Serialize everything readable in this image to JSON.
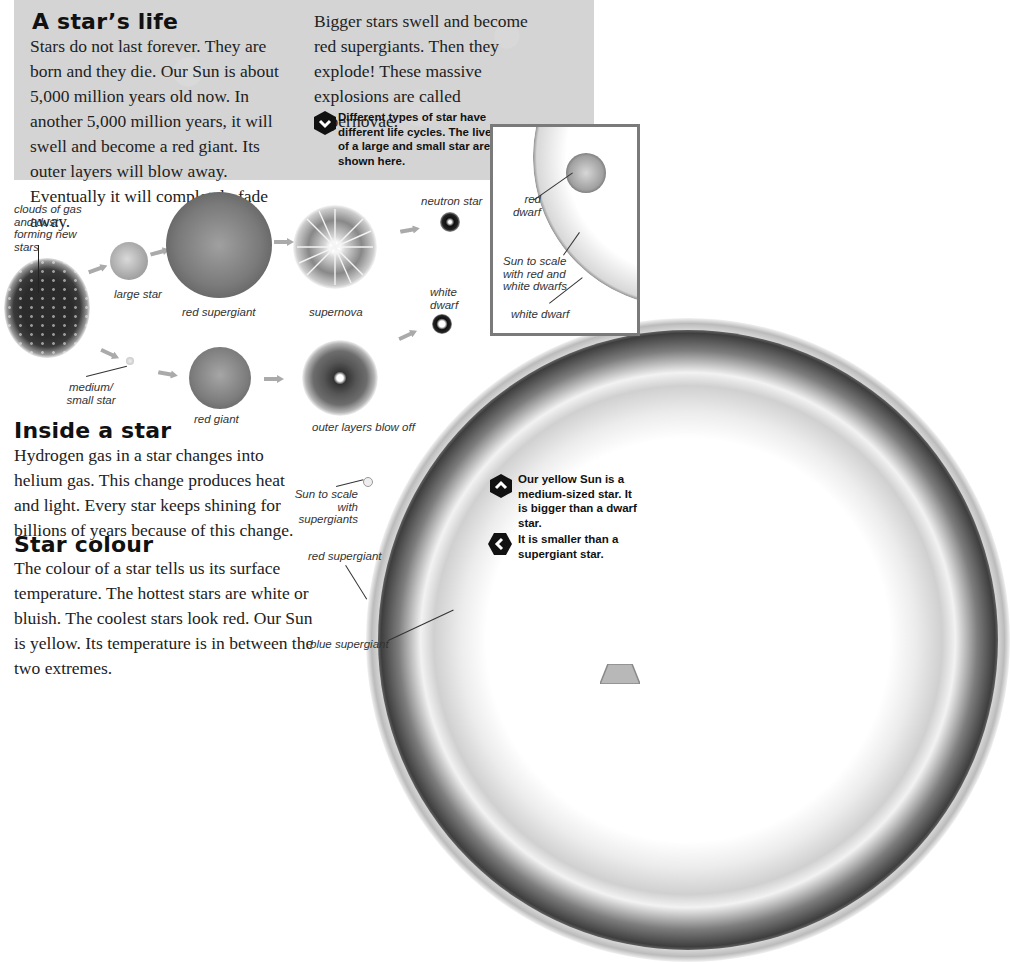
{
  "intro_section": {
    "title": "A star’s life",
    "body_left": "Stars do not last forever. They are born and they die. Our Sun is about 5,000 million years old now. In another 5,000 million years, it will swell and become a red giant. Its outer layers will blow away. Eventually it will completely fade away.",
    "body_right": "Bigger stars swell and become red supergiants. Then they explode! These massive explosions are called supernovae.",
    "note": {
      "icon": "hexagon-chevron-down-icon",
      "text": "Different types of star have different life cycles. The lives of a large and small star are shown here."
    }
  },
  "life_cycle_diagram": {
    "nebula_label": "clouds of gas and dust forming new stars",
    "large_path": [
      {
        "label": "large star"
      },
      {
        "label": "red supergiant"
      },
      {
        "label": "supernova"
      },
      {
        "label": "neutron star"
      }
    ],
    "small_path": [
      {
        "label": "medium/ small star"
      },
      {
        "label": "red giant"
      },
      {
        "label": "outer layers blow off"
      },
      {
        "label": "white dwarf"
      }
    ]
  },
  "inset": {
    "labels": {
      "red_dwarf": "red dwarf",
      "sun_scale": "Sun to scale with red and white dwarfs",
      "white_dwarf": "white dwarf"
    }
  },
  "inside_section": {
    "title": "Inside a star",
    "body": "Hydrogen gas in a star changes into helium gas. This change produces heat and light. Every star keeps shining for billions of years because of this change."
  },
  "colour_section": {
    "title": "Star colour",
    "body": "The colour of a star tells us its surface temperature. The hottest stars are white or bluish. The coolest stars look red. Our Sun is yellow. Its temperature is in between the two extremes."
  },
  "supergiant_labels": {
    "sun_scale": "Sun to scale with supergiants",
    "red_supergiant": "red supergiant",
    "blue_supergiant": "blue supergiant"
  },
  "sun_notes": [
    {
      "icon": "hexagon-chevron-up-icon",
      "text": "Our yellow Sun is a medium-sized star. It is bigger than a dwarf star."
    },
    {
      "icon": "hexagon-chevron-left-icon",
      "text": "It is smaller than a supergiant star."
    }
  ]
}
